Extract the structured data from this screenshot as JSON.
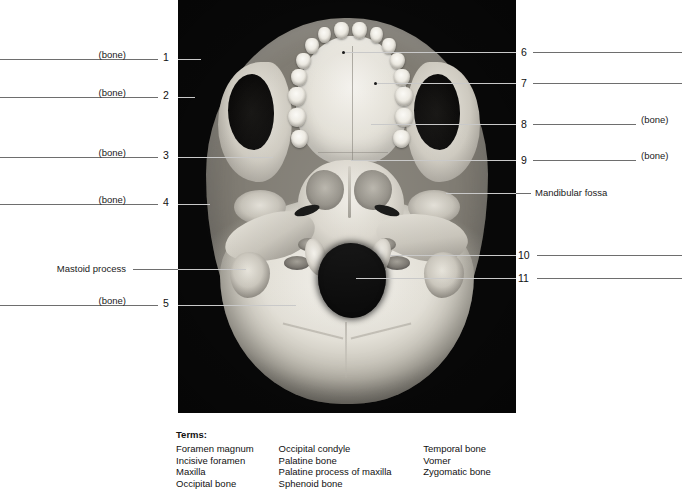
{
  "figure": {
    "type": "anatomical-photograph",
    "photo_alt": "Inferior view of a human skull showing hard palate, teeth, foramen magnum and occipital condyles"
  },
  "left_labels": [
    {
      "id": "l1",
      "text": "(bone)",
      "number": "1"
    },
    {
      "id": "l2",
      "text": "(bone)",
      "number": "2"
    },
    {
      "id": "l3",
      "text": "(bone)",
      "number": "3"
    },
    {
      "id": "l4",
      "text": "(bone)",
      "number": "4"
    },
    {
      "id": "l-mastoid",
      "text": "Mastoid process",
      "number": ""
    },
    {
      "id": "l5",
      "text": "(bone)",
      "number": "5"
    }
  ],
  "right_labels": [
    {
      "id": "r6",
      "number": "6",
      "text": ""
    },
    {
      "id": "r7",
      "number": "7",
      "text": ""
    },
    {
      "id": "r8",
      "number": "8",
      "text": "(bone)"
    },
    {
      "id": "r9",
      "number": "9",
      "text": "(bone)"
    },
    {
      "id": "r-fossa",
      "number": "",
      "text": "Mandibular fossa"
    },
    {
      "id": "r10",
      "number": "10",
      "text": ""
    },
    {
      "id": "r11",
      "number": "11",
      "text": ""
    }
  ],
  "terms": {
    "title": "Terms:",
    "columns": [
      [
        "Foramen magnum",
        "Incisive foramen",
        "Maxilla",
        "Occipital bone"
      ],
      [
        "Occipital condyle",
        "Palatine bone",
        "Palatine process of maxilla",
        "Sphenoid bone"
      ],
      [
        "Temporal bone",
        "Vomer",
        "Zygomatic bone"
      ]
    ]
  },
  "colors": {
    "background": "#ffffff",
    "photo_background": "#080808",
    "bone_light": "#f2efe8",
    "bone_mid": "#cfccc2",
    "bone_shadow": "#8a867d",
    "leader_line": "#6e6e6e",
    "leader_line_on_photo": "#c9c9c9",
    "text": "#1a1a1a"
  }
}
